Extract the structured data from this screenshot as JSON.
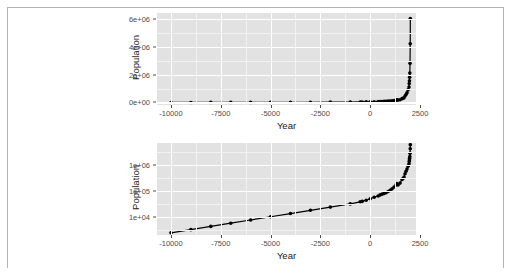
{
  "page": {
    "background_color": "#ffffff",
    "frame_color": "#b4b4b4"
  },
  "style": {
    "panel_background": "#e2e2e2",
    "gridline_major_color": "#ffffff",
    "gridline_minor_color": "#f2f2f2",
    "data_color": "#000000",
    "axis_text_color": "#4d4d4d",
    "axis_title_color": "#1a1a1a"
  },
  "chart_data": [
    {
      "id": "population-linear",
      "type": "line",
      "title": "",
      "xlabel": "Year",
      "ylabel": "Population",
      "yscale": "linear",
      "xscale": "linear",
      "grid": true,
      "legend": "none",
      "xlim": [
        -10700,
        2300
      ],
      "ylim": [
        -180000,
        6400000
      ],
      "xticks": [
        -10000,
        -7500,
        -5000,
        -2500,
        0,
        2500
      ],
      "xticklabels": [
        "-10000",
        "-7500",
        "-5000",
        "-2500",
        "0",
        "2500"
      ],
      "yticks": [
        0,
        2000000,
        4000000,
        6000000
      ],
      "yticklabels": [
        "0e+00",
        "2e+06",
        "4e+06",
        "6e+06"
      ],
      "markers": true,
      "x": [
        -10000,
        -9000,
        -8000,
        -7000,
        -6000,
        -5000,
        -4000,
        -3000,
        -2000,
        -1000,
        -500,
        -400,
        -200,
        1,
        200,
        400,
        500,
        600,
        700,
        800,
        900,
        1000,
        1100,
        1200,
        1300,
        1340,
        1400,
        1500,
        1600,
        1650,
        1700,
        1750,
        1800,
        1850,
        1900,
        1950,
        1960,
        1970,
        1980,
        1990,
        2000,
        2010,
        2015
      ],
      "y": [
        2431,
        3213,
        4285,
        5701,
        7586,
        10091,
        13424,
        17858,
        23757,
        31606,
        38019,
        39560,
        43800,
        50000,
        57000,
        64000,
        70000,
        75000,
        80000,
        85000,
        95000,
        105000,
        120000,
        140000,
        170000,
        190000,
        170000,
        200000,
        275000,
        300000,
        340000,
        460000,
        570000,
        700000,
        900000,
        1100000,
        1350000,
        1550000,
        1800000,
        2100000,
        2800000,
        4200000,
        6000000
      ]
    },
    {
      "id": "population-log",
      "type": "line",
      "title": "",
      "xlabel": "Year",
      "ylabel": "Population",
      "yscale": "log",
      "xscale": "linear",
      "grid": true,
      "legend": "none",
      "xlim": [
        -10700,
        2300
      ],
      "ylim": [
        2000,
        7000000
      ],
      "xticks": [
        -10000,
        -7500,
        -5000,
        -2500,
        0,
        2500
      ],
      "xticklabels": [
        "-10000",
        "-7500",
        "-5000",
        "-2500",
        "0",
        "2500"
      ],
      "yticks": [
        10000,
        100000,
        1000000
      ],
      "yticklabels": [
        "1e+04",
        "1e+05",
        "1e+06"
      ],
      "markers": true,
      "x": [
        -10000,
        -9000,
        -8000,
        -7000,
        -6000,
        -5000,
        -4000,
        -3000,
        -2000,
        -1000,
        -500,
        -400,
        -200,
        1,
        200,
        400,
        500,
        600,
        700,
        800,
        900,
        1000,
        1100,
        1200,
        1300,
        1340,
        1400,
        1500,
        1600,
        1650,
        1700,
        1750,
        1800,
        1850,
        1900,
        1950,
        1960,
        1970,
        1980,
        1990,
        2000,
        2010,
        2015
      ],
      "y": [
        2431,
        3213,
        4285,
        5701,
        7586,
        10091,
        13424,
        17858,
        23757,
        31606,
        38019,
        39560,
        43800,
        50000,
        57000,
        64000,
        70000,
        75000,
        80000,
        85000,
        95000,
        105000,
        120000,
        140000,
        170000,
        190000,
        170000,
        200000,
        275000,
        300000,
        340000,
        460000,
        570000,
        700000,
        900000,
        1100000,
        1350000,
        1550000,
        1800000,
        2100000,
        2800000,
        4200000,
        6000000
      ]
    }
  ]
}
